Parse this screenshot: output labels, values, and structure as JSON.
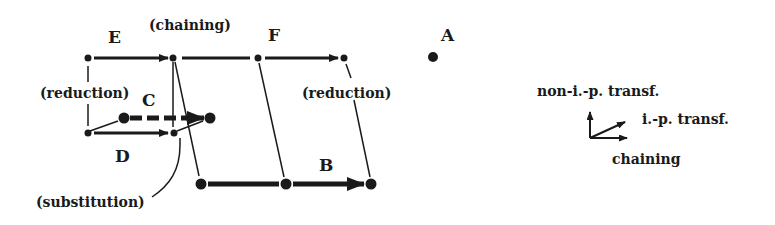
{
  "diagram": {
    "labels": {
      "E": "E",
      "F": "F",
      "A": "A",
      "B": "B",
      "C": "C",
      "D": "D",
      "chaining_top": "(chaining)",
      "reduction_left": "(reduction)",
      "reduction_right": "(reduction)",
      "substitution": "(substitution)"
    },
    "legend": {
      "non_ip": "non-i.-p. transf.",
      "ip": "i.-p. transf.",
      "chaining": "chaining"
    },
    "colors": {
      "ink": "#1a1a1a",
      "background": "#ffffff"
    }
  }
}
